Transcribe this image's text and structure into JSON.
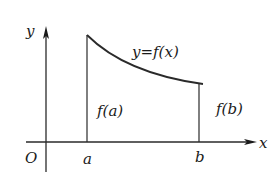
{
  "diagram": {
    "type": "function-graph",
    "axes": {
      "x_label": "x",
      "y_label": "y",
      "origin_label": "O"
    },
    "curve": {
      "label": "y=f(x)",
      "shape": "decreasing, concave up"
    },
    "points": {
      "a_label": "a",
      "b_label": "b"
    },
    "verticals": {
      "fa_label": "f(a)",
      "fb_label": "f(b)"
    },
    "colors": {
      "stroke": "#2a2a2a",
      "background": "#ffffff"
    }
  }
}
